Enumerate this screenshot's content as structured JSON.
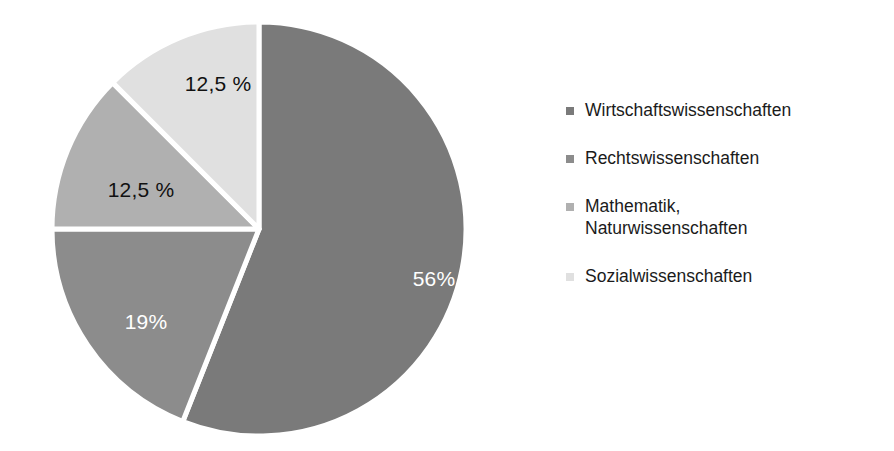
{
  "chart_data": {
    "type": "pie",
    "title": "",
    "subtitle": "",
    "xlabel": "",
    "ylabel": "",
    "grid": false,
    "legend_position": "right",
    "start_angle_deg": 0,
    "direction": "clockwise",
    "categories": [
      "Wirtschaftswissenschaften",
      "Rechtswissenschaften",
      "Mathematik, Naturwissenschaften",
      "Sozialwissenschaften"
    ],
    "values": [
      56,
      19,
      12.5,
      12.5
    ],
    "data_labels": [
      "56%",
      "19%",
      "12,5 %",
      "12,5 %"
    ],
    "colors": [
      "#7a7a7a",
      "#8c8c8c",
      "#b0b0b0",
      "#e0e0e0"
    ],
    "slice_separator_color": "#ffffff",
    "background_color": "#ffffff",
    "slices": [
      {
        "label": "Wirtschaftswissenschaften",
        "value": 56,
        "data_label": "56%",
        "color": "#7a7a7a",
        "label_color": "#ffffff",
        "start_deg": 0,
        "end_deg": 201.6,
        "label_x": 406,
        "label_y": 279
      },
      {
        "label": "Rechtswissenschaften",
        "value": 19,
        "data_label": "19%",
        "color": "#8c8c8c",
        "label_color": "#ffffff",
        "start_deg": 201.6,
        "end_deg": 270,
        "label_x": 118,
        "label_y": 322
      },
      {
        "label": "Mathematik, Naturwissenschaften",
        "value": 12.5,
        "data_label": "12,5 %",
        "color": "#b0b0b0",
        "label_color": "#111111",
        "start_deg": 270,
        "end_deg": 315,
        "label_x": 113,
        "label_y": 190
      },
      {
        "label": "Sozialwissenschaften",
        "value": 12.5,
        "data_label": "12,5 %",
        "color": "#e0e0e0",
        "label_color": "#111111",
        "start_deg": 315,
        "end_deg": 360,
        "label_x": 190,
        "label_y": 84
      }
    ]
  },
  "legend": {
    "items": [
      {
        "label": "Wirtschaftswissenschaften",
        "color": "#7a7a7a",
        "marker": "square-marker"
      },
      {
        "label": "Rechtswissenschaften",
        "color": "#8c8c8c",
        "marker": "square-marker"
      },
      {
        "label": "Mathematik,\nNaturwissenschaften",
        "color": "#b0b0b0",
        "marker": "square-marker"
      },
      {
        "label": "Sozialwissenschaften",
        "color": "#e0e0e0",
        "marker": "square-marker"
      }
    ]
  }
}
